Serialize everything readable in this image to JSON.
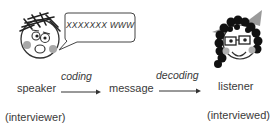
{
  "diagram": {
    "speaker_bubble": "XXXXXXX WWW",
    "nodes": [
      {
        "id": "speaker",
        "label": "speaker",
        "role": "(interviewer)"
      },
      {
        "id": "message",
        "label": "message"
      },
      {
        "id": "listener",
        "label": "listener",
        "role": "(interviewed)"
      }
    ],
    "edges": [
      {
        "from": "speaker",
        "to": "message",
        "label": "coding"
      },
      {
        "from": "message",
        "to": "listener",
        "label": "decoding"
      }
    ],
    "colors": {
      "line": "#333333",
      "cheek": "#a8a8a8",
      "bow": "#9a9a9a",
      "hair": "#111111"
    }
  }
}
